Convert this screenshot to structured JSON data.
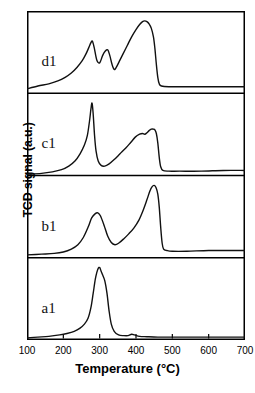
{
  "chart_data": {
    "type": "line",
    "title": "",
    "xlabel": "Temperature (°C)",
    "ylabel": "TCD signal (a.u.)",
    "xlim": [
      100,
      700
    ],
    "ylim": [
      0,
      4
    ],
    "xticks": [
      100,
      200,
      300,
      400,
      500,
      600,
      700
    ],
    "xticklabels": [
      "100",
      "200",
      "300",
      "400",
      "500",
      "600",
      "700"
    ],
    "yticks": [],
    "yticklabels": [],
    "grid": false,
    "legend": false,
    "legend_position": "none",
    "line_color": "#111111",
    "line_width": 1.4,
    "background": "#ffffff",
    "frame_color": "#000000",
    "annotations": [
      {
        "text": "d1",
        "x": 140,
        "panel": 3
      },
      {
        "text": "c1",
        "x": 140,
        "panel": 2
      },
      {
        "text": "b1",
        "x": 140,
        "panel": 1
      },
      {
        "text": "a1",
        "x": 140,
        "panel": 0
      }
    ],
    "panels": [
      {
        "name": "a1",
        "label": "a1",
        "order": 0,
        "peaks": [
          {
            "temperature": 300,
            "relative_height": 1.0,
            "note": "main sharp peak"
          },
          {
            "temperature": 390,
            "relative_height": 0.05,
            "note": "small bump"
          }
        ],
        "baseline_drop_temperature": 330,
        "x": [
          100,
          130,
          160,
          190,
          210,
          230,
          245,
          258,
          268,
          276,
          282,
          288,
          292,
          296,
          300,
          304,
          308,
          314,
          320,
          326,
          332,
          340,
          352,
          366,
          378,
          388,
          396,
          410,
          430,
          460,
          500,
          560,
          620,
          700
        ],
        "y": [
          0.03,
          0.04,
          0.05,
          0.07,
          0.09,
          0.12,
          0.16,
          0.22,
          0.3,
          0.45,
          0.64,
          0.84,
          0.93,
          0.99,
          1.0,
          0.95,
          0.9,
          0.82,
          0.65,
          0.4,
          0.22,
          0.12,
          0.07,
          0.06,
          0.06,
          0.08,
          0.07,
          0.05,
          0.045,
          0.04,
          0.04,
          0.04,
          0.04,
          0.04
        ]
      },
      {
        "name": "b1",
        "label": "b1",
        "order": 1,
        "peaks": [
          {
            "temperature": 295,
            "relative_height": 0.62,
            "note": "first peak"
          },
          {
            "temperature": 450,
            "relative_height": 1.0,
            "note": "main peak"
          }
        ],
        "baseline_drop_temperature": 470,
        "x": [
          100,
          140,
          175,
          200,
          222,
          240,
          255,
          268,
          278,
          288,
          295,
          302,
          312,
          322,
          332,
          342,
          352,
          366,
          380,
          394,
          408,
          420,
          430,
          438,
          444,
          450,
          455,
          460,
          464,
          468,
          472,
          476,
          485,
          500,
          540,
          600,
          660,
          700
        ],
        "y": [
          0.04,
          0.05,
          0.06,
          0.08,
          0.12,
          0.18,
          0.28,
          0.42,
          0.55,
          0.61,
          0.62,
          0.58,
          0.45,
          0.3,
          0.21,
          0.18,
          0.2,
          0.26,
          0.33,
          0.41,
          0.52,
          0.66,
          0.8,
          0.92,
          0.98,
          1.0,
          0.97,
          0.88,
          0.7,
          0.42,
          0.2,
          0.12,
          0.1,
          0.09,
          0.09,
          0.1,
          0.1,
          0.1
        ]
      },
      {
        "name": "c1",
        "label": "c1",
        "order": 2,
        "peaks": [
          {
            "temperature": 280,
            "relative_height": 1.0,
            "note": "sharp narrow peak"
          },
          {
            "temperature": 420,
            "relative_height": 0.58,
            "note": "shoulder"
          },
          {
            "temperature": 445,
            "relative_height": 0.64,
            "note": "broad peak"
          }
        ],
        "baseline_drop_temperature": 465,
        "x": [
          100,
          140,
          170,
          195,
          215,
          232,
          246,
          258,
          266,
          272,
          276,
          279,
          282,
          286,
          290,
          296,
          304,
          314,
          326,
          340,
          356,
          372,
          386,
          398,
          410,
          418,
          424,
          430,
          436,
          442,
          448,
          452,
          456,
          460,
          464,
          468,
          474,
          490,
          520,
          580,
          640,
          700
        ],
        "y": [
          0.02,
          0.03,
          0.05,
          0.08,
          0.13,
          0.2,
          0.3,
          0.42,
          0.55,
          0.75,
          0.92,
          1.0,
          0.86,
          0.55,
          0.34,
          0.2,
          0.14,
          0.13,
          0.16,
          0.22,
          0.3,
          0.38,
          0.46,
          0.53,
          0.57,
          0.58,
          0.57,
          0.59,
          0.62,
          0.64,
          0.64,
          0.63,
          0.58,
          0.45,
          0.25,
          0.12,
          0.07,
          0.06,
          0.06,
          0.06,
          0.07,
          0.07
        ]
      },
      {
        "name": "d1",
        "label": "d1",
        "order": 3,
        "peaks": [
          {
            "temperature": 280,
            "relative_height": 0.72,
            "note": "first peak"
          },
          {
            "temperature": 322,
            "relative_height": 0.6,
            "note": "second peak"
          },
          {
            "temperature": 425,
            "relative_height": 1.0,
            "note": "main peak"
          }
        ],
        "baseline_drop_temperature": 460,
        "x": [
          100,
          130,
          160,
          185,
          205,
          222,
          238,
          252,
          262,
          270,
          276,
          280,
          285,
          292,
          300,
          308,
          315,
          322,
          328,
          334,
          340,
          346,
          354,
          364,
          376,
          388,
          400,
          410,
          418,
          424,
          430,
          436,
          442,
          448,
          452,
          456,
          460,
          464,
          470,
          490,
          540,
          600,
          660,
          700
        ],
        "y": [
          0.06,
          0.1,
          0.13,
          0.17,
          0.22,
          0.28,
          0.36,
          0.45,
          0.54,
          0.63,
          0.7,
          0.72,
          0.63,
          0.46,
          0.42,
          0.52,
          0.58,
          0.6,
          0.52,
          0.4,
          0.33,
          0.36,
          0.44,
          0.54,
          0.66,
          0.78,
          0.88,
          0.95,
          0.99,
          1.0,
          0.99,
          0.96,
          0.9,
          0.78,
          0.62,
          0.4,
          0.22,
          0.13,
          0.1,
          0.09,
          0.09,
          0.09,
          0.09,
          0.09
        ]
      }
    ]
  },
  "axis": {
    "xlabel": "Temperature (°C)",
    "ylabel": "TCD signal (a.u.)",
    "xticklabels": [
      "100",
      "200",
      "300",
      "400",
      "500",
      "600",
      "700"
    ]
  }
}
